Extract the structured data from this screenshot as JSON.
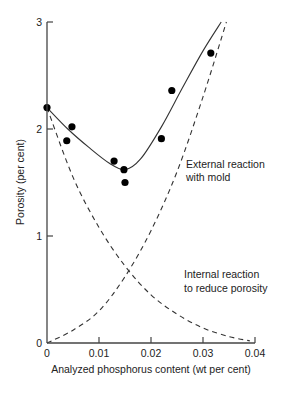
{
  "chart_data": {
    "type": "scatter",
    "title": "",
    "xlabel": "Analyzed phosphorus content (wt per cent)",
    "ylabel": "Porosity (per cent)",
    "xlim": [
      0,
      0.04
    ],
    "ylim": [
      0,
      3
    ],
    "x_ticks": [
      "0",
      "0.01",
      "0.02",
      "0.03",
      "0.04"
    ],
    "y_ticks": [
      "0",
      "1",
      "2",
      "3"
    ],
    "grid": false,
    "legend": null,
    "series": [
      {
        "name": "Measured porosity",
        "kind": "scatter",
        "points": [
          [
            0.0,
            2.2
          ],
          [
            0.0038,
            1.89
          ],
          [
            0.0048,
            2.02
          ],
          [
            0.0129,
            1.7
          ],
          [
            0.0148,
            1.62
          ],
          [
            0.015,
            1.5
          ],
          [
            0.022,
            1.91
          ],
          [
            0.024,
            2.36
          ],
          [
            0.0315,
            2.71
          ]
        ]
      },
      {
        "name": "Fitted total curve",
        "kind": "line-solid",
        "points": [
          [
            0.0,
            2.2
          ],
          [
            0.004,
            2.0
          ],
          [
            0.008,
            1.83
          ],
          [
            0.012,
            1.68
          ],
          [
            0.015,
            1.62
          ],
          [
            0.018,
            1.72
          ],
          [
            0.022,
            2.02
          ],
          [
            0.026,
            2.38
          ],
          [
            0.03,
            2.73
          ],
          [
            0.0335,
            3.0
          ]
        ]
      },
      {
        "name": "External reaction with mold",
        "kind": "line-dashed",
        "points": [
          [
            0.0,
            0.0
          ],
          [
            0.005,
            0.12
          ],
          [
            0.01,
            0.3
          ],
          [
            0.015,
            0.62
          ],
          [
            0.02,
            1.05
          ],
          [
            0.025,
            1.6
          ],
          [
            0.03,
            2.3
          ],
          [
            0.0345,
            3.0
          ]
        ]
      },
      {
        "name": "Internal reaction to reduce porosity",
        "kind": "line-dashed",
        "points": [
          [
            0.0,
            2.2
          ],
          [
            0.005,
            1.55
          ],
          [
            0.01,
            1.08
          ],
          [
            0.015,
            0.72
          ],
          [
            0.02,
            0.45
          ],
          [
            0.025,
            0.27
          ],
          [
            0.03,
            0.14
          ],
          [
            0.035,
            0.06
          ],
          [
            0.039,
            0.02
          ]
        ]
      }
    ],
    "annotations": [
      {
        "text_line1": "External reaction",
        "text_line2": "with mold",
        "x": 0.027,
        "y": 1.75
      },
      {
        "text_line1": "Internal reaction",
        "text_line2": "to reduce porosity",
        "x": 0.027,
        "y": 0.75
      }
    ]
  }
}
